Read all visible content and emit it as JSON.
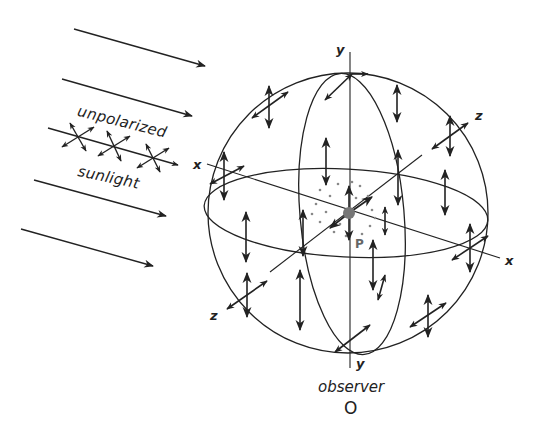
{
  "figure": {
    "labels": {
      "unpolarized": "unpolarized",
      "sunlight": "sunlight",
      "observer": "observer",
      "observer_point": "O",
      "point_p": "P",
      "axis_x_left": "x",
      "axis_x_right": "x",
      "axis_y_top": "y",
      "axis_y_bottom": "y",
      "axis_z_left": "z",
      "axis_z_right": "z"
    },
    "colors": {
      "ink": "#222222",
      "point_p": "#777777",
      "dots": "#888888",
      "background": "#ffffff"
    },
    "incoming_rays": 4,
    "sphere": {
      "cx": 348,
      "cy": 213,
      "r": 140
    }
  }
}
